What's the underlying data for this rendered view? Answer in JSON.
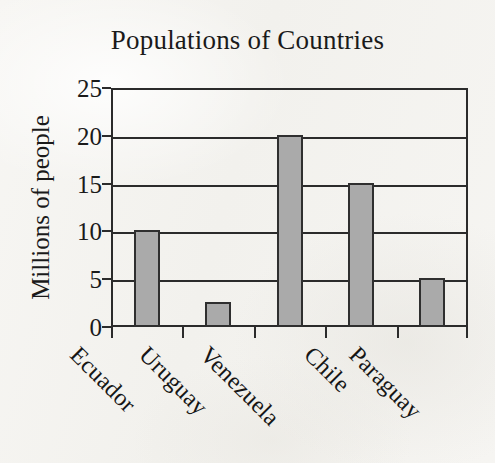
{
  "chart_data": {
    "type": "bar",
    "title": "Populations of Countries",
    "xlabel": "",
    "ylabel": "Millions of people",
    "categories": [
      "Ecuador",
      "Uruguay",
      "Venezuela",
      "Chile",
      "Paraguay"
    ],
    "values": [
      10,
      2.5,
      20,
      15,
      5
    ],
    "ylim": [
      0,
      25
    ],
    "yticks": [
      0,
      5,
      10,
      15,
      20,
      25
    ],
    "ytick_labels": [
      "0",
      "5",
      "10",
      "15",
      "20",
      "25"
    ],
    "grid": true,
    "grid_axis": "y",
    "legend": false,
    "legend_position": "none",
    "bar_fill_color": "#aaaaaa",
    "bar_edge_color": "#2f2f2f",
    "axis_color": "#2b2b2b",
    "background_color": "#f5f4f1",
    "text_color": "#1a1a1a",
    "x_label_rotation": 45
  }
}
